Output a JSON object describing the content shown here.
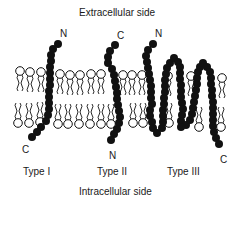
{
  "diagram": {
    "top_label": "Extracellular side",
    "bottom_label": "Intracellular side",
    "proteins": [
      {
        "type_label": "Type I",
        "top_terminus": "N",
        "bottom_terminus": "C"
      },
      {
        "type_label": "Type II",
        "top_terminus": "C",
        "bottom_terminus": "N"
      },
      {
        "type_label": "Type III",
        "top_terminus": "N",
        "bottom_terminus": "C"
      }
    ]
  }
}
